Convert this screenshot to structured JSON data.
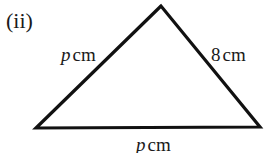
{
  "figure": {
    "part_label": "(ii)",
    "shape": "triangle",
    "vertices": {
      "apex": [
        161,
        6
      ],
      "bottom_left": [
        36,
        128
      ],
      "bottom_right": [
        260,
        127
      ]
    },
    "stroke_color": "#111111",
    "sides": {
      "left": {
        "variable": "p",
        "unit": "cm"
      },
      "right": {
        "variable": "8",
        "unit": "cm"
      },
      "bottom": {
        "variable": "p",
        "unit": "cm"
      }
    }
  }
}
